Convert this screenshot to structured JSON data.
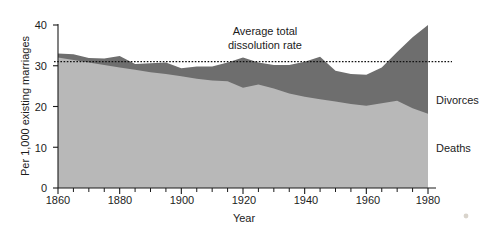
{
  "chart_data": {
    "type": "area",
    "stacked": true,
    "title": "",
    "xlabel": "Year",
    "ylabel": "Per 1,000 existing marriages",
    "xlim": [
      1860,
      1980
    ],
    "ylim": [
      0,
      40
    ],
    "xticks": [
      1860,
      1880,
      1900,
      1920,
      1940,
      1960,
      1980
    ],
    "xtick_labels": [
      "1860",
      "1880",
      "1900",
      "1920",
      "1940",
      "1960",
      "1980"
    ],
    "x_minor_tick_step": 5,
    "yticks": [
      0,
      10,
      20,
      30,
      40
    ],
    "ytick_labels": [
      "0",
      "10",
      "20",
      "30",
      "40"
    ],
    "grid": false,
    "legend_position": "right-inline",
    "colors": {
      "deaths": "#b8b8b8",
      "divorces": "#6e6e6e",
      "average_line": "#111111",
      "axis": "#1a1a1a",
      "background": "#ffffff"
    },
    "x": [
      1860,
      1865,
      1870,
      1875,
      1880,
      1885,
      1890,
      1895,
      1900,
      1905,
      1910,
      1915,
      1920,
      1925,
      1930,
      1935,
      1940,
      1945,
      1950,
      1955,
      1960,
      1965,
      1970,
      1975,
      1980
    ],
    "series": [
      {
        "name": "Deaths",
        "label": "Deaths",
        "color": "#b8b8b8",
        "values": [
          32.0,
          31.4,
          30.8,
          30.2,
          29.6,
          29.0,
          28.4,
          28.0,
          27.4,
          26.8,
          26.4,
          26.2,
          24.6,
          25.4,
          24.4,
          23.2,
          22.4,
          21.8,
          21.2,
          20.6,
          20.2,
          20.8,
          21.4,
          19.6,
          18.2
        ]
      },
      {
        "name": "Divorces",
        "label": "Divorces",
        "color": "#6e6e6e",
        "values": [
          1.0,
          1.4,
          1.1,
          1.6,
          2.8,
          1.4,
          2.2,
          2.8,
          2.0,
          3.0,
          3.4,
          4.6,
          7.4,
          5.4,
          5.8,
          7.0,
          8.6,
          10.4,
          7.6,
          7.4,
          7.6,
          8.8,
          12.0,
          17.4,
          21.8
        ]
      }
    ],
    "total_label": "Average total dissolution rate",
    "total": [
      33.0,
      32.8,
      31.9,
      31.8,
      32.4,
      30.4,
      30.6,
      30.8,
      29.4,
      29.8,
      29.8,
      30.8,
      32.0,
      30.8,
      30.2,
      30.2,
      31.0,
      32.2,
      28.8,
      28.0,
      27.8,
      29.6,
      33.4,
      37.0,
      40.0
    ],
    "average_total_dissolution_rate": 31.0,
    "annotations": [
      {
        "name": "average-total-dissolution-rate",
        "line1": "Average total",
        "line2": "dissolution rate",
        "value": 31.0
      }
    ]
  },
  "labels": {
    "y_axis_title": "Per 1,000 existing marriages",
    "x_axis_title": "Year",
    "divorces": "Divorces",
    "deaths": "Deaths",
    "annotation_line1": "Average total",
    "annotation_line2": "dissolution rate",
    "y_0": "0",
    "y_10": "10",
    "y_20": "20",
    "y_30": "30",
    "y_40": "40",
    "x_1860": "1860",
    "x_1880": "1880",
    "x_1900": "1900",
    "x_1920": "1920",
    "x_1940": "1940",
    "x_1960": "1960",
    "x_1980": "1980"
  }
}
